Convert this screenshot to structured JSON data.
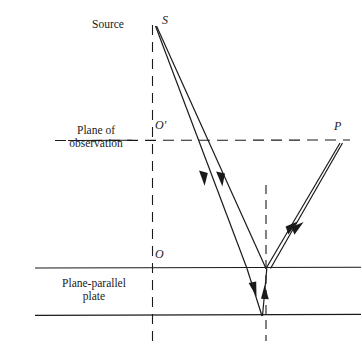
{
  "figure": {
    "background_color": "#ffffff",
    "line_color": "#1a1a1a",
    "width": 362,
    "height": 355
  },
  "labels": {
    "source": "Source",
    "source_point": "S",
    "observation_point": "O′",
    "image_point": "P",
    "origin_point": "O",
    "plane_of_observation_line1": "Plane of",
    "plane_of_observation_line2": "observation",
    "plate_line1": "Plane-parallel",
    "plate_line2": "plate"
  },
  "geometry": {
    "source": {
      "x": 155,
      "y": 25
    },
    "axis_vertical": {
      "x": 152,
      "y_top": 25,
      "y_bottom": 345,
      "style": "dashed"
    },
    "normal_vertical": {
      "x": 266,
      "y_top": 185,
      "y_bottom": 341,
      "style": "dashed"
    },
    "plane_of_observation": {
      "y": 140,
      "x_start": 55,
      "x_end": 350,
      "style": "dashed"
    },
    "plate_top_surface": {
      "y": 268,
      "x_start": 35,
      "x_end": 360,
      "style": "solid"
    },
    "plate_bottom_surface": {
      "y": 315,
      "x_start": 35,
      "x_end": 360,
      "style": "solid"
    },
    "point_P": {
      "x": 341,
      "y": 142
    },
    "entry_point_left": {
      "x": 247,
      "y": 268
    },
    "entry_point_right": {
      "x": 266,
      "y": 268
    },
    "bottom_reflection_point": {
      "x": 262,
      "y": 315
    }
  },
  "rays": [
    {
      "name": "incident-ray-1",
      "from": "S",
      "to": "left-entry-point",
      "direction": "down",
      "arrowhead_at": {
        "x": 204,
        "y": 180
      }
    },
    {
      "name": "incident-ray-2",
      "from": "S",
      "to": "right-entry-point",
      "direction": "down",
      "arrowhead_at": {
        "x": 221,
        "y": 180
      }
    },
    {
      "name": "refracted-ray-down",
      "from": "left-entry-point",
      "to": "bottom-reflection-point",
      "direction": "down",
      "arrowhead_at": {
        "x": 255,
        "y": 291
      }
    },
    {
      "name": "internal-reflected-ray-up",
      "from": "bottom-reflection-point",
      "to": "right-entry-point",
      "direction": "up",
      "arrowhead_at": {
        "x": 264,
        "y": 292
      }
    },
    {
      "name": "reflected-ray-to-P",
      "from": "right-entry-point",
      "to": "P",
      "direction": "up",
      "arrowhead_at": {
        "x": 295,
        "y": 229
      }
    },
    {
      "name": "emergent-ray-to-P",
      "from": "right-entry-point",
      "to": "P",
      "direction": "up",
      "arrowhead_at": {
        "x": 301,
        "y": 224
      }
    }
  ],
  "colors": {
    "ink": "#1a1a1a",
    "background": "#ffffff"
  }
}
